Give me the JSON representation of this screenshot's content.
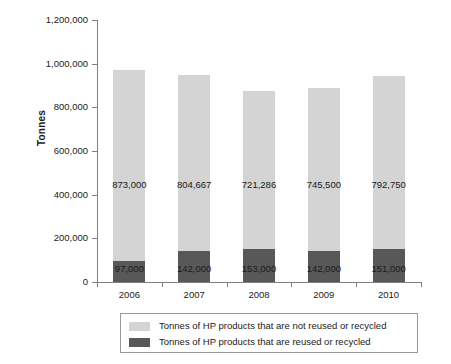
{
  "chart_data": {
    "type": "bar",
    "subtype": "stacked-column",
    "title": "",
    "xlabel": "",
    "ylabel": "Tonnes",
    "categories": [
      "2006",
      "2007",
      "2008",
      "2009",
      "2010"
    ],
    "ylim": [
      0,
      1200000
    ],
    "y_ticks": [
      0,
      200000,
      400000,
      600000,
      800000,
      1000000,
      1200000
    ],
    "y_tick_labels": [
      "0",
      "200,000",
      "400,000",
      "600,000",
      "800,000",
      "1,000,000",
      "1,200,000"
    ],
    "grid": false,
    "legend_position": "bottom",
    "series": [
      {
        "name": "Tonnes of HP products that are not reused or recycled",
        "color": "#d4d4d4",
        "values": [
          873000,
          804667,
          721286,
          745500,
          792750
        ],
        "labels": [
          "873,000",
          "804,667",
          "721,286",
          "745,500",
          "792,750"
        ]
      },
      {
        "name": "Tonnes of HP products that are reused or recycled",
        "color": "#585858",
        "values": [
          97000,
          142000,
          153000,
          142000,
          151000
        ],
        "labels": [
          "97,000",
          "142,000",
          "153,000",
          "142,000",
          "151,000"
        ]
      }
    ]
  },
  "axis": {
    "y_title": "Tonnes"
  },
  "legend": {
    "items": [
      {
        "label": "Tonnes of HP products that are not reused or recycled",
        "color": "#d4d4d4"
      },
      {
        "label": "Tonnes of HP products that are reused or recycled",
        "color": "#585858"
      }
    ]
  }
}
